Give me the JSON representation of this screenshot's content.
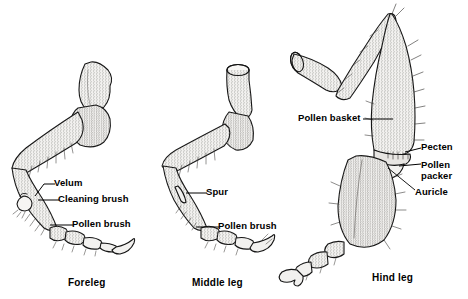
{
  "figure": {
    "background_color": "#ffffff",
    "ink_color": "#1a1a1a",
    "fill_color": "#efeeec",
    "width": 468,
    "height": 299
  },
  "captions": [
    {
      "text": "Foreleg",
      "x": 68,
      "y": 277
    },
    {
      "text": "Middle leg",
      "x": 192,
      "y": 277
    },
    {
      "text": "Hind leg",
      "x": 372,
      "y": 272
    }
  ],
  "labels": [
    {
      "id": "velum",
      "text": "Velum",
      "x": 54,
      "y": 183,
      "leg": "foreleg"
    },
    {
      "id": "cleaning-brush",
      "text": "Cleaning brush",
      "x": 58,
      "y": 199,
      "leg": "foreleg"
    },
    {
      "id": "pollen-brush-fore",
      "text": "Pollen brush",
      "x": 72,
      "y": 224,
      "leg": "foreleg"
    },
    {
      "id": "spur",
      "text": "Spur",
      "x": 206,
      "y": 192,
      "leg": "middle"
    },
    {
      "id": "pollen-brush-mid",
      "text": "Pollen brush",
      "x": 218,
      "y": 226,
      "leg": "middle"
    },
    {
      "id": "pollen-basket",
      "text": "Pollen basket",
      "x": 298,
      "y": 113,
      "leg": "hind"
    },
    {
      "id": "pecten",
      "text": "Pecten",
      "x": 421,
      "y": 147,
      "leg": "hind"
    },
    {
      "id": "pollen-packer",
      "text": "Pollen packer",
      "x": 421,
      "y": 166,
      "leg": "hind"
    },
    {
      "id": "auricle",
      "text": "Auricle",
      "x": 415,
      "y": 192,
      "leg": "hind"
    }
  ]
}
